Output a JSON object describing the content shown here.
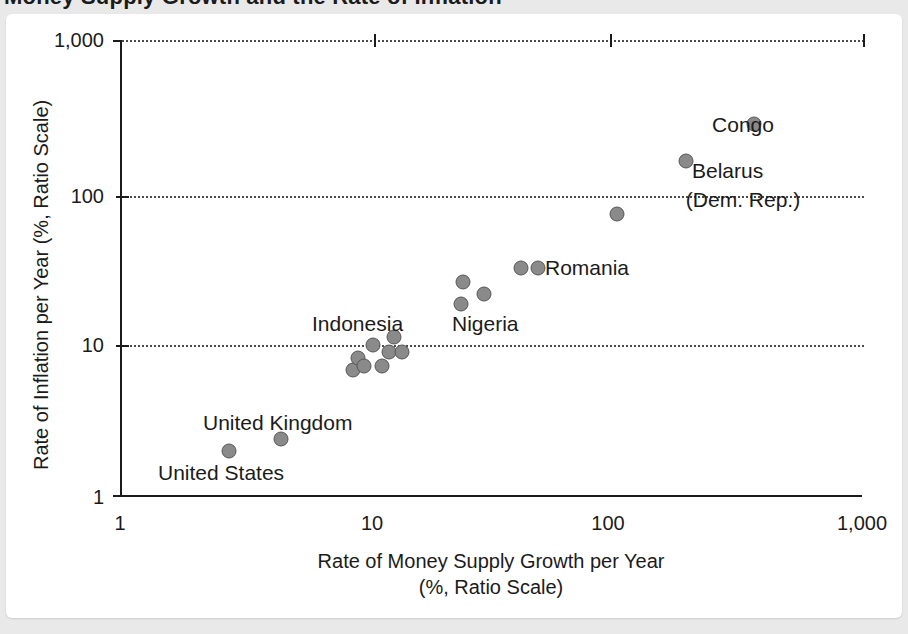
{
  "figure": {
    "title_partial": "Money Supply Growth and the Rate of Inflation",
    "background_color": "#e9e9e9",
    "card_color": "#ffffff",
    "point_color": "#8a8a8a",
    "point_border_color": "#565656",
    "axis_color": "#1b1b1b",
    "gridline_color": "#4a4a4a"
  },
  "chart_data": {
    "type": "scatter",
    "title": "Money Supply Growth and the Rate of Inflation",
    "xlabel": "Rate of Money Supply Growth per Year\n(%, Ratio Scale)",
    "xlabel_line1": "Rate of Money Supply Growth per Year",
    "xlabel_line2": "(%, Ratio Scale)",
    "ylabel": "Rate of Inflation per Year (%, Ratio Scale)",
    "xscale": "log",
    "yscale": "log",
    "xlim": [
      1,
      1000
    ],
    "ylim": [
      1,
      1000
    ],
    "xticks": [
      1,
      10,
      100,
      1000
    ],
    "xticklabels": [
      "1",
      "10",
      "100",
      "1,000"
    ],
    "yticks": [
      1,
      10,
      100,
      1000
    ],
    "yticklabels": [
      "1",
      "10",
      "100",
      "1,000"
    ],
    "grid": "horizontal dotted at 10, 100, 1,000",
    "legend": "none",
    "points": [
      {
        "label": "United States",
        "x": 2.7,
        "y": 2.0
      },
      {
        "label": "United Kingdom",
        "x": 4.4,
        "y": 2.4
      },
      {
        "label": "",
        "x": 8.6,
        "y": 6.8
      },
      {
        "label": "",
        "x": 9.0,
        "y": 8.2
      },
      {
        "label": "",
        "x": 9.5,
        "y": 7.3
      },
      {
        "label": "Indonesia",
        "x": 10.3,
        "y": 10.0
      },
      {
        "label": "",
        "x": 11.2,
        "y": 7.2
      },
      {
        "label": "",
        "x": 12.0,
        "y": 9.0
      },
      {
        "label": "",
        "x": 12.6,
        "y": 11.3
      },
      {
        "label": "",
        "x": 13.5,
        "y": 8.9
      },
      {
        "label": "",
        "x": 24.0,
        "y": 26.0
      },
      {
        "label": "Nigeria",
        "x": 23.5,
        "y": 18.5
      },
      {
        "label": "",
        "x": 29.0,
        "y": 21.5
      },
      {
        "label": "",
        "x": 41.0,
        "y": 32.0
      },
      {
        "label": "Romania",
        "x": 48.0,
        "y": 32.0
      },
      {
        "label": "",
        "x": 100.0,
        "y": 72.0
      },
      {
        "label": "Belarus",
        "x": 190.0,
        "y": 160.0
      },
      {
        "label": "Congo (Dem. Rep.)",
        "x": 360.0,
        "y": 280.0
      }
    ],
    "annotations": [
      {
        "text": "Congo\n(Dem. Rep.)",
        "line1": "Congo",
        "line2": "(Dem. Rep.)",
        "anchor_x": 743,
        "anchor_y": 78
      },
      {
        "text": "Belarus",
        "line1": "Belarus",
        "line2": "",
        "anchor_x": 692,
        "anchor_y": 171
      },
      {
        "text": "Romania",
        "line1": "Romania",
        "line2": "",
        "anchor_x": 545,
        "anchor_y": 268
      },
      {
        "text": "Nigeria",
        "line1": "Nigeria",
        "line2": "",
        "anchor_x": 452,
        "anchor_y": 324
      },
      {
        "text": "Indonesia",
        "line1": "Indonesia",
        "line2": "",
        "anchor_x": 312,
        "anchor_y": 324
      },
      {
        "text": "United Kingdom",
        "line1": "United Kingdom",
        "line2": "",
        "anchor_x": 203,
        "anchor_y": 423
      },
      {
        "text": "United States",
        "line1": "United States",
        "line2": "",
        "anchor_x": 158,
        "anchor_y": 473
      }
    ]
  },
  "axes": {
    "y_title": "Rate of Inflation per Year (%, Ratio Scale)",
    "x_title_line1": "Rate of Money Supply Growth per Year",
    "x_title_line2": "(%, Ratio Scale)",
    "y_tick_1000": "1,000",
    "y_tick_100": "100",
    "y_tick_10": "10",
    "y_tick_1": "1",
    "x_tick_1": "1",
    "x_tick_10": "10",
    "x_tick_100": "100",
    "x_tick_1000": "1,000"
  }
}
